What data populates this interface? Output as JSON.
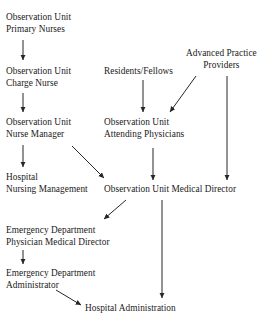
{
  "diagram": {
    "background_color": "#ffffff",
    "text_color": "#1a1a1a",
    "edge_color": "#262626",
    "nodes": [
      {
        "id": "observation-unit-primary-nurses",
        "label": "Observation Unit\nPrimary Nurses",
        "x": 6,
        "y": 12,
        "align": "left"
      },
      {
        "id": "observation-unit-charge-nurse",
        "label": "Observation Unit\nCharge Nurse",
        "x": 6,
        "y": 66,
        "align": "left"
      },
      {
        "id": "residents-fellows",
        "label": "Residents/Fellows",
        "x": 104,
        "y": 66,
        "align": "left"
      },
      {
        "id": "advanced-practice-providers",
        "label": "Advanced Practice\nProviders",
        "x": 186,
        "y": 48,
        "align": "center"
      },
      {
        "id": "observation-unit-nurse-manager",
        "label": "Observation Unit\nNurse Manager",
        "x": 6,
        "y": 117,
        "align": "left"
      },
      {
        "id": "observation-unit-attending-physicians",
        "label": "Observation Unit\nAttending Physicians",
        "x": 104,
        "y": 117,
        "align": "left"
      },
      {
        "id": "hospital-nursing-management",
        "label": "Hospital\nNursing Management",
        "x": 6,
        "y": 172,
        "align": "left"
      },
      {
        "id": "observation-unit-medical-director",
        "label": "Observation Unit Medical Director",
        "x": 104,
        "y": 184,
        "align": "left"
      },
      {
        "id": "emergency-department-physician-medical-director",
        "label": "Emergency Department\nPhysician Medical Director",
        "x": 6,
        "y": 225,
        "align": "left"
      },
      {
        "id": "emergency-department-administrator",
        "label": "Emergency Department\nAdministrator",
        "x": 6,
        "y": 268,
        "align": "left"
      },
      {
        "id": "hospital-administration",
        "label": "Hospital Administration",
        "x": 85,
        "y": 303,
        "align": "left"
      }
    ],
    "edges": [
      {
        "id": "primary-nurses-to-charge-nurse",
        "from": "observation-unit-primary-nurses",
        "to": "observation-unit-charge-nurse",
        "x1": 23,
        "y1": 40,
        "x2": 23,
        "y2": 60,
        "kind": "vertical"
      },
      {
        "id": "charge-nurse-to-nurse-manager",
        "from": "observation-unit-charge-nurse",
        "to": "observation-unit-nurse-manager",
        "x1": 23,
        "y1": 93,
        "x2": 23,
        "y2": 112,
        "kind": "vertical"
      },
      {
        "id": "residents-fellows-to-attending-physicians",
        "from": "residents-fellows",
        "to": "observation-unit-attending-physicians",
        "x1": 143,
        "y1": 80,
        "x2": 143,
        "y2": 112,
        "kind": "vertical"
      },
      {
        "id": "advanced-practice-providers-to-attending-physicians",
        "from": "advanced-practice-providers",
        "to": "observation-unit-attending-physicians",
        "x1": 196,
        "y1": 76,
        "x2": 170,
        "y2": 112,
        "kind": "diagonal"
      },
      {
        "id": "advanced-practice-providers-to-medical-director",
        "from": "advanced-practice-providers",
        "to": "observation-unit-medical-director",
        "x1": 227,
        "y1": 76,
        "x2": 227,
        "y2": 180,
        "kind": "vertical"
      },
      {
        "id": "nurse-manager-to-hospital-nursing-management",
        "from": "observation-unit-nurse-manager",
        "to": "hospital-nursing-management",
        "x1": 23,
        "y1": 145,
        "x2": 23,
        "y2": 167,
        "kind": "vertical"
      },
      {
        "id": "nurse-manager-to-medical-director",
        "from": "observation-unit-nurse-manager",
        "to": "observation-unit-medical-director",
        "x1": 72,
        "y1": 146,
        "x2": 104,
        "y2": 178,
        "kind": "diagonal"
      },
      {
        "id": "attending-physicians-to-medical-director",
        "from": "observation-unit-attending-physicians",
        "to": "observation-unit-medical-director",
        "x1": 153,
        "y1": 148,
        "x2": 153,
        "y2": 180,
        "kind": "vertical"
      },
      {
        "id": "medical-director-to-ed-physician-medical-director",
        "from": "observation-unit-medical-director",
        "to": "emergency-department-physician-medical-director",
        "x1": 126,
        "y1": 200,
        "x2": 104,
        "y2": 219,
        "kind": "diagonal"
      },
      {
        "id": "medical-director-to-hospital-administration",
        "from": "observation-unit-medical-director",
        "to": "hospital-administration",
        "x1": 162,
        "y1": 200,
        "x2": 162,
        "y2": 298,
        "kind": "vertical"
      },
      {
        "id": "ed-physician-medical-director-to-ed-administrator",
        "from": "emergency-department-physician-medical-director",
        "to": "emergency-department-administrator",
        "x1": 23,
        "y1": 250,
        "x2": 23,
        "y2": 264,
        "kind": "vertical"
      },
      {
        "id": "ed-administrator-to-hospital-administration",
        "from": "emergency-department-administrator",
        "to": "hospital-administration",
        "x1": 56,
        "y1": 290,
        "x2": 81,
        "y2": 305,
        "kind": "diagonal"
      }
    ]
  }
}
